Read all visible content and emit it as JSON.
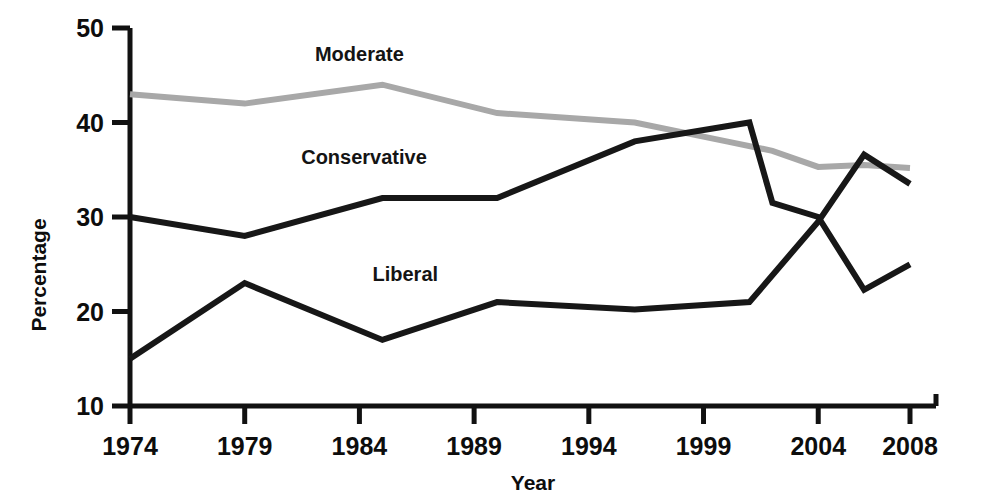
{
  "chart_data": {
    "type": "line",
    "title": "",
    "xlabel": "Year",
    "ylabel": "Percentage",
    "xlim": [
      1974,
      2008
    ],
    "ylim": [
      10,
      50
    ],
    "ytick_labels": [
      "50",
      "40",
      "30",
      "20",
      "10"
    ],
    "yticks": [
      50,
      40,
      30,
      20,
      10
    ],
    "xtick_labels": [
      "1974",
      "1979",
      "1984",
      "1989",
      "1994",
      "1999",
      "2004",
      "2008"
    ],
    "xticks": [
      1974,
      1979,
      1984,
      1989,
      1994,
      1999,
      2004,
      2008
    ],
    "grid": false,
    "legend": "inline-labels",
    "series": [
      {
        "name": "Moderate",
        "color": "#a8a8a8",
        "label_x": 1984,
        "label_y": 46.5,
        "points": [
          {
            "x": 1974,
            "y": 43
          },
          {
            "x": 1979,
            "y": 42
          },
          {
            "x": 1985,
            "y": 44
          },
          {
            "x": 1990,
            "y": 41
          },
          {
            "x": 1993,
            "y": 40.5
          },
          {
            "x": 1996,
            "y": 40
          },
          {
            "x": 2000,
            "y": 38
          },
          {
            "x": 2002,
            "y": 37
          },
          {
            "x": 2004,
            "y": 35.3
          },
          {
            "x": 2006,
            "y": 35.5
          },
          {
            "x": 2008,
            "y": 35.2
          }
        ]
      },
      {
        "name": "Conservative",
        "color": "#171717",
        "label_x": 1984.2,
        "label_y": 35.6,
        "points": [
          {
            "x": 1974,
            "y": 30
          },
          {
            "x": 1979,
            "y": 28
          },
          {
            "x": 1985,
            "y": 32
          },
          {
            "x": 1990,
            "y": 32
          },
          {
            "x": 1996,
            "y": 38
          },
          {
            "x": 2001,
            "y": 40
          },
          {
            "x": 2002,
            "y": 31.5
          },
          {
            "x": 2004,
            "y": 30
          },
          {
            "x": 2006,
            "y": 22.3
          },
          {
            "x": 2008,
            "y": 25
          }
        ]
      },
      {
        "name": "Liberal",
        "color": "#171717",
        "label_x": 1986,
        "label_y": 23.2,
        "points": [
          {
            "x": 1974,
            "y": 15
          },
          {
            "x": 1979,
            "y": 23
          },
          {
            "x": 1985,
            "y": 17
          },
          {
            "x": 1990,
            "y": 21
          },
          {
            "x": 1996,
            "y": 20.2
          },
          {
            "x": 2001,
            "y": 21
          },
          {
            "x": 2004,
            "y": 29.5
          },
          {
            "x": 2006,
            "y": 36.6
          },
          {
            "x": 2008,
            "y": 33.5
          }
        ]
      }
    ]
  }
}
